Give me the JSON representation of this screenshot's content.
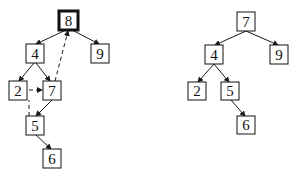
{
  "colors": {
    "stroke": "#1a1a1a",
    "background": "#ffffff"
  },
  "left_tree": {
    "nodes": [
      {
        "id": "8",
        "label": "8",
        "x": 59,
        "y": 11,
        "w": 19,
        "h": 19,
        "highlighted": true
      },
      {
        "id": "4",
        "label": "4",
        "x": 26,
        "y": 44,
        "w": 18,
        "h": 19
      },
      {
        "id": "9",
        "label": "9",
        "x": 91,
        "y": 44,
        "w": 18,
        "h": 19
      },
      {
        "id": "2",
        "label": "2",
        "x": 9,
        "y": 81,
        "w": 18,
        "h": 19
      },
      {
        "id": "7",
        "label": "7",
        "x": 43,
        "y": 81,
        "w": 18,
        "h": 19
      },
      {
        "id": "5",
        "label": "5",
        "x": 26,
        "y": 116,
        "w": 18,
        "h": 19
      },
      {
        "id": "6",
        "label": "6",
        "x": 43,
        "y": 149,
        "w": 18,
        "h": 19
      }
    ],
    "edges": [
      {
        "from": "8",
        "to": "4",
        "style": "solid"
      },
      {
        "from": "8",
        "to": "9",
        "style": "solid"
      },
      {
        "from": "4",
        "to": "2",
        "style": "solid"
      },
      {
        "from": "4",
        "to": "7",
        "style": "solid"
      },
      {
        "from": "7",
        "to": "5",
        "style": "solid"
      },
      {
        "from": "5",
        "to": "6",
        "style": "solid"
      }
    ],
    "dashed_arrows": [
      {
        "from": "7",
        "to": "8",
        "note": "successor moves up to replace root"
      },
      {
        "from": "2",
        "to": "7",
        "note": "dashed arrow from 2 to 7"
      },
      {
        "from": "5",
        "to": "2",
        "note": "dashed vertical line from 5 up toward 2"
      }
    ]
  },
  "right_tree": {
    "nodes": [
      {
        "id": "7",
        "label": "7",
        "x": 237,
        "y": 12,
        "w": 18,
        "h": 19
      },
      {
        "id": "4",
        "label": "4",
        "x": 205,
        "y": 45,
        "w": 18,
        "h": 19
      },
      {
        "id": "9",
        "label": "9",
        "x": 270,
        "y": 45,
        "w": 18,
        "h": 19
      },
      {
        "id": "2",
        "label": "2",
        "x": 188,
        "y": 82,
        "w": 18,
        "h": 18
      },
      {
        "id": "5",
        "label": "5",
        "x": 221,
        "y": 82,
        "w": 18,
        "h": 18
      },
      {
        "id": "6",
        "label": "6",
        "x": 237,
        "y": 116,
        "w": 18,
        "h": 18
      }
    ],
    "edges": [
      {
        "from": "7",
        "to": "4",
        "style": "solid"
      },
      {
        "from": "7",
        "to": "9",
        "style": "solid"
      },
      {
        "from": "4",
        "to": "2",
        "style": "solid"
      },
      {
        "from": "4",
        "to": "5",
        "style": "solid"
      },
      {
        "from": "5",
        "to": "6",
        "style": "solid"
      }
    ]
  }
}
